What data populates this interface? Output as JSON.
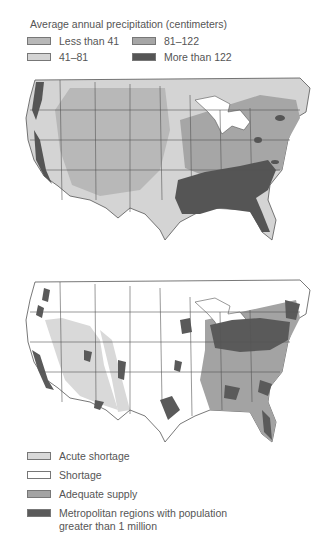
{
  "precipitation_map": {
    "title": "Average annual precipitation (centimeters)",
    "legend": [
      {
        "label": "Less than 41",
        "color": "#b8b8b8"
      },
      {
        "label": "81–122",
        "color": "#a6a6a6"
      },
      {
        "label": "41–81",
        "color": "#d4d4d4"
      },
      {
        "label": "More than 122",
        "color": "#555555"
      }
    ]
  },
  "water_supply_map": {
    "legend": [
      {
        "label": "Acute shortage",
        "color": "#d9d9d9"
      },
      {
        "label": "Shortage",
        "color": "#ffffff"
      },
      {
        "label": "Adequate supply",
        "color": "#a3a3a3"
      },
      {
        "label": "Metropolitan regions with population",
        "label_line2": "greater than 1 million",
        "color": "#5a5a5a"
      }
    ]
  },
  "colors": {
    "border": "#555555",
    "text": "#555555"
  }
}
